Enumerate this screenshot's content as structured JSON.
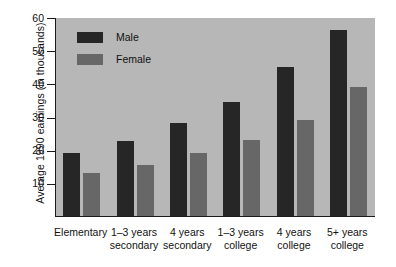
{
  "chart_data": {
    "type": "bar",
    "title": "",
    "xlabel": "",
    "ylabel": "Average 1990 earnings (in thousands)",
    "ylim": [
      0,
      60
    ],
    "yticks": [
      10,
      20,
      30,
      40,
      50,
      60
    ],
    "grid": false,
    "legend_position": "top-left",
    "categories": [
      "Elementary",
      "1–3 years secondary",
      "4 years secondary",
      "1–3 years college",
      "4 years college",
      "5+ years college"
    ],
    "category_lines": [
      [
        "Elementary",
        ""
      ],
      [
        "1–3 years",
        "secondary"
      ],
      [
        "4 years",
        "secondary"
      ],
      [
        "1–3 years",
        "college"
      ],
      [
        "4 years",
        "college"
      ],
      [
        "5+ years",
        "college"
      ]
    ],
    "series": [
      {
        "name": "Male",
        "color": "#262626",
        "values": [
          19,
          22.5,
          28,
          34.5,
          45,
          56
        ]
      },
      {
        "name": "Female",
        "color": "#676767",
        "values": [
          13,
          15.5,
          19,
          23,
          29,
          39
        ]
      }
    ]
  },
  "colors": {
    "plot_background": "#b7b7b7",
    "axis": "#1a1a1a",
    "page_background": "#ffffff",
    "male": "#262626",
    "female": "#676767"
  }
}
